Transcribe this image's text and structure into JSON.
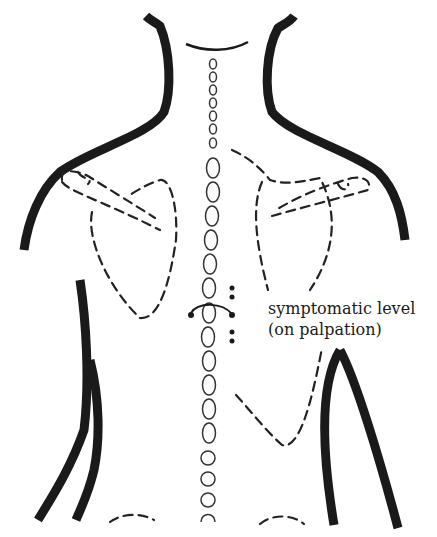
{
  "diagram": {
    "annotation": {
      "line1": "symptomatic level",
      "line2": "(on palpation)"
    },
    "colors": {
      "outline": "#1a1a1a",
      "background": "#ffffff"
    }
  }
}
